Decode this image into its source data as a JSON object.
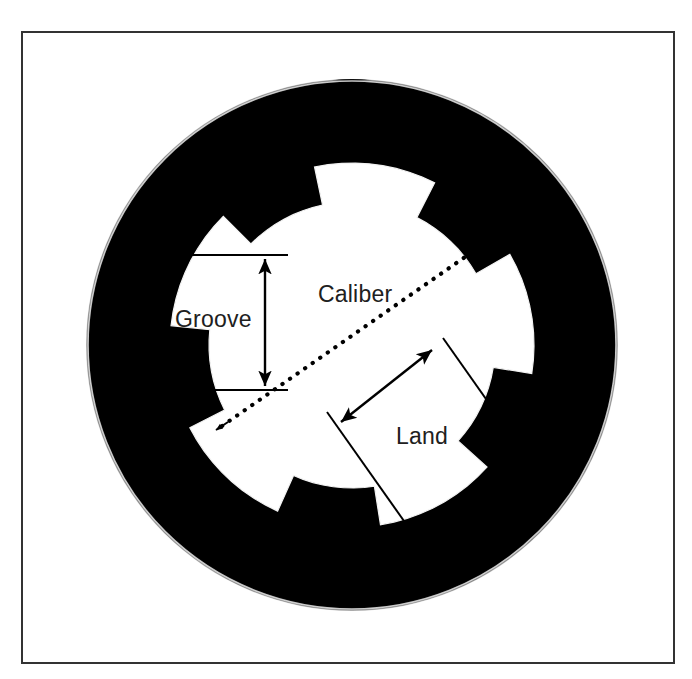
{
  "figure": {
    "kind": "technical-diagram",
    "frame": {
      "name": "figure-border",
      "x": 22,
      "y": 32,
      "width": 652,
      "height": 631,
      "stroke_color": "#333333",
      "fill_color": "#ffffff",
      "stroke_width": 2
    },
    "barrel": {
      "name": "barrel-body",
      "center_x": 352,
      "center_y": 345,
      "outer_radius": 265,
      "fill_color": "#000000",
      "highlight_color": "#ffffff"
    },
    "bore": {
      "name": "barrel-bore",
      "fill_color": "#ffffff",
      "land_radius": 143,
      "groove_radius": 182,
      "groove_count": 5,
      "start_angle_deg": -63
    },
    "sight_post": {
      "name": "front-sight-post",
      "x": 336,
      "y": 28,
      "width": 30,
      "height": 58,
      "fill_color": "#111111"
    },
    "annotations": [
      {
        "id": "groove",
        "label": "Groove",
        "label_x": 175,
        "label_y": 327,
        "arrow": {
          "type": "double-headed-solid",
          "x1": 265,
          "y1": 258,
          "x2": 265,
          "y2": 388
        },
        "extension_lines": [
          {
            "x1": 186,
            "y1": 255,
            "x2": 286,
            "y2": 255
          },
          {
            "x1": 175,
            "y1": 390,
            "x2": 286,
            "y2": 390
          }
        ],
        "color": "#000000"
      },
      {
        "id": "caliber",
        "label": "Caliber",
        "label_x": 318,
        "label_y": 302,
        "arrow": {
          "type": "double-headed-dotted",
          "x1": 212,
          "y1": 433,
          "x2": 487,
          "y2": 242
        },
        "color": "#000000"
      },
      {
        "id": "land",
        "label": "Land",
        "label_x": 396,
        "label_y": 444,
        "arrow": {
          "type": "double-headed-solid",
          "x1": 337,
          "y1": 425,
          "x2": 436,
          "y2": 347
        },
        "extension_lines": [
          {
            "x1": 327,
            "y1": 412,
            "x2": 404,
            "y2": 521
          },
          {
            "x1": 443,
            "y1": 338,
            "x2": 516,
            "y2": 441
          }
        ],
        "color": "#000000"
      }
    ],
    "palette": {
      "ink": "#000000",
      "paper": "#ffffff",
      "border": "#333333"
    }
  }
}
